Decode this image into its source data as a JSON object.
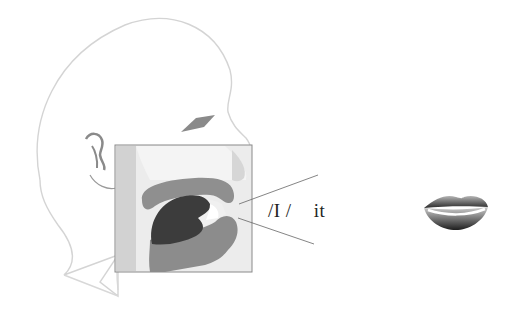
{
  "diagram": {
    "phoneme": {
      "symbol": "/I /",
      "example_word": "it"
    },
    "parts": {
      "head": "head-outline",
      "ear": "ear",
      "eye": "eye",
      "sagittal_section": "vocal-tract-cross-section",
      "tongue": "tongue",
      "palate": "hard-palate",
      "jaw": "lower-jaw",
      "lips_front_view": "lips-spread"
    },
    "colors": {
      "outline": "#d4d4d4",
      "section_bg": "#e6e6e6",
      "section_border": "#8a8a8a",
      "pharynx": "#d0d0d0",
      "tissue": "#8c8c8c",
      "tongue": "#3c3c3c",
      "pointer_line": "#555555",
      "text": "#222222"
    }
  }
}
